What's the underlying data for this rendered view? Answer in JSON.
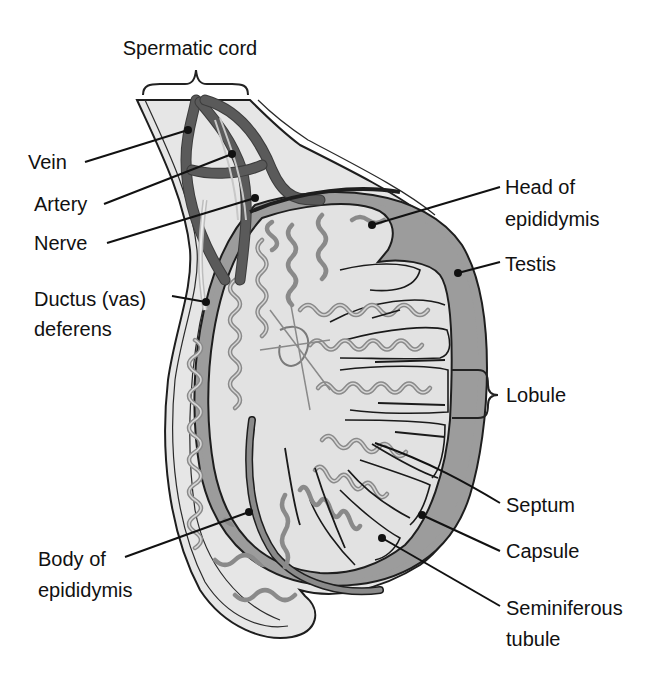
{
  "figure": {
    "colors": {
      "background": "#ffffff",
      "tissue_fill": "#e4e4e4",
      "tunica_fill": "#9a9a9a",
      "vessel": "#5a5a5a",
      "tubule": "#8a8a8a",
      "outline": "#1e1e1e",
      "label_text": "#111111"
    }
  },
  "labels": {
    "spermatic_cord": "Spermatic cord",
    "vein": "Vein",
    "artery": "Artery",
    "nerve": "Nerve",
    "ductus_line1": "Ductus (vas)",
    "ductus_line2": "deferens",
    "head_line1": "Head of",
    "head_line2": "epididymis",
    "testis": "Testis",
    "lobule": "Lobule",
    "septum": "Septum",
    "capsule": "Capsule",
    "seminiferous_line1": "Seminiferous",
    "seminiferous_line2": "tubule",
    "body_line1": "Body of",
    "body_line2": "epididymis"
  }
}
